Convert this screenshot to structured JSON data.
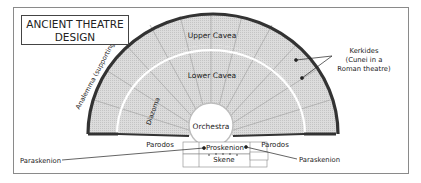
{
  "title": {
    "line1": "ANCIENT THEATRE",
    "line2": "DESIGN"
  },
  "labels": {
    "upper_cavea": "Upper Cavea",
    "lower_cavea": "Lower Cavea",
    "orchestra": "Orchestra",
    "diazoma": "Diazoma",
    "analemma": "Analemma (supporting wall)",
    "kerkides_line1": "Kerkides",
    "kerkides_line2": "(Cunei in a",
    "kerkides_line3": "Roman theatre)",
    "parodos_left": "Parodos",
    "parodos_right": "Parodos",
    "proskenion": "Proskenion",
    "skene": "Skene",
    "paraskenion_left": "Paraskenion",
    "paraskenion_right": "Paraskenion"
  },
  "colors": {
    "seating_fill": "#d9d9d9",
    "wall": "#333333",
    "divider": "#ffffff",
    "frame": "#8a8a8a"
  }
}
